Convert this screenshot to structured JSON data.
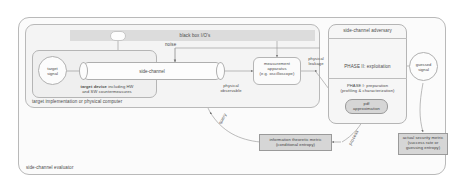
{
  "diagram": {
    "outer_frame": {
      "label": "side-channel evaluator"
    },
    "target_frame": {
      "label": "target implementation or physical computer"
    },
    "device_frame": {
      "label_bold": "target device",
      "label_rest": "including HW",
      "label_line2": "and SW countermeasures"
    },
    "nodes": {
      "target_signal": "target\nsignal",
      "target_signal_l1": "target",
      "target_signal_l2": "signal",
      "side_channel": "side-channel",
      "measurement": "measurement\napparatus\n(e.g. oscilloscope)",
      "measurement_l1": "measurement",
      "measurement_l2": "apparatus",
      "measurement_l3": "(e.g. oscilloscope)",
      "adversary": "side-channel adversary",
      "phase2": "PHASE II: exploitation",
      "phase1_l1": "PHASE I: preparation",
      "phase1_l2": "(profiling & characterization)",
      "pdf_l1": "pdf",
      "pdf_l2": "approximation",
      "guessed_l1": "guessed",
      "guessed_l2": "signal",
      "it_metric_l1": "information theoretic metric",
      "it_metric_l2": "(conditional entropy)",
      "sec_metric_l1": "actual security metric",
      "sec_metric_l2": "(success rate or",
      "sec_metric_l3": "guessing entropy)"
    },
    "edge_labels": {
      "black_box": "black box I/O's",
      "noise": "noise",
      "physical_observable_l1": "physical",
      "physical_observable_l2": "observable",
      "physical_leakage_l1": "physical",
      "physical_leakage_l2": "leakage",
      "query": "query",
      "process": "process"
    },
    "colors": {
      "stroke": "#9f9f9f",
      "shade_fill": "#d6d6d6",
      "panel_fill": "#fbfbfb",
      "text": "#4a4a4a"
    }
  }
}
